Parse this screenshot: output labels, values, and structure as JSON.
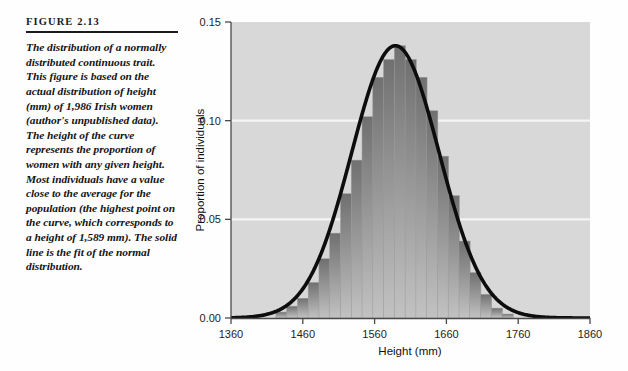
{
  "figure": {
    "label": "FIGURE 2.13",
    "caption": "The distribution of a normally distributed continuous trait. This figure is based on the actual distribution of height (mm) of 1,986 Irish women (author's unpublished data). The height of the curve represents the proportion of women with any given height. Most individuals have a value close to the average for the population (the highest point on the curve, which corresponds to a height of 1,589 mm). The solid line is the fit of the normal distribution."
  },
  "colors": {
    "plot_background": "#d8d8d8",
    "bar_fill_dark": "#707070",
    "bar_fill_light": "#b9b9b9",
    "gridline": "#f2f2f2",
    "curve": "#0d0d0d",
    "axis": "#3a3a3a",
    "text": "#141414"
  },
  "chart_data": {
    "type": "bar",
    "title": "",
    "subtitle": "",
    "xlabel": "Height (mm)",
    "ylabel": "Proportion of individuals",
    "xlim": [
      1360,
      1860
    ],
    "ylim": [
      0.0,
      0.15
    ],
    "xticks": [
      1360,
      1460,
      1560,
      1660,
      1760,
      1860
    ],
    "xtick_labels": [
      "1360",
      "1460",
      "1560",
      "1660",
      "1760",
      "1860"
    ],
    "yticks": [
      0.0,
      0.05,
      0.1,
      0.15
    ],
    "ytick_labels": [
      "0.00",
      "0.05",
      "0.10",
      "0.15"
    ],
    "grid": true,
    "legend": "none",
    "bin_width": 15,
    "categories": [
      1430,
      1445,
      1460,
      1475,
      1490,
      1505,
      1520,
      1535,
      1550,
      1565,
      1580,
      1595,
      1610,
      1625,
      1640,
      1655,
      1670,
      1685,
      1700,
      1715,
      1730,
      1745
    ],
    "values": [
      0.003,
      0.006,
      0.01,
      0.018,
      0.03,
      0.043,
      0.063,
      0.08,
      0.102,
      0.122,
      0.131,
      0.138,
      0.131,
      0.122,
      0.105,
      0.082,
      0.062,
      0.039,
      0.023,
      0.012,
      0.005,
      0.002
    ],
    "series": [
      {
        "name": "Observed distribution of height",
        "type": "bar",
        "values": [
          0.003,
          0.006,
          0.01,
          0.018,
          0.03,
          0.043,
          0.063,
          0.08,
          0.102,
          0.122,
          0.131,
          0.138,
          0.131,
          0.122,
          0.105,
          0.082,
          0.062,
          0.039,
          0.023,
          0.012,
          0.005,
          0.002
        ]
      },
      {
        "name": "Fit of the normal distribution",
        "type": "line",
        "mean": 1589,
        "sd": 61,
        "peak_value": 0.138,
        "peak_x": 1589
      }
    ],
    "annotations": [
      {
        "text": "1,986 Irish women",
        "kind": "sample-size"
      },
      {
        "text": "mean height 1,589 mm",
        "kind": "distribution-mean"
      }
    ]
  }
}
